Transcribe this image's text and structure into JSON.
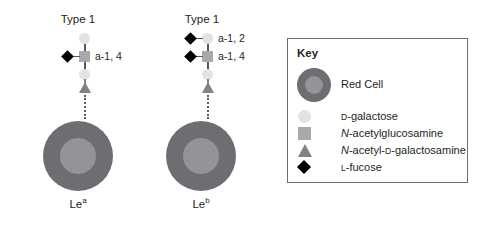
{
  "figure": {
    "background_color": "#ffffff",
    "palette": {
      "red_cell_outer": "#6d6e71",
      "red_cell_inner": "#929497",
      "d_galactose": "#e3e3e1",
      "n_acetylglucosamine": "#a7a9ac",
      "n_acetyl_d_galactosamine": "#808285",
      "l_fucose": "#000000",
      "line": "#58595b",
      "key_border": "#6d6e71",
      "text": "#231f20"
    }
  },
  "panels": [
    {
      "id": "lewis-a",
      "chain_type_label": "Type 1",
      "antigen_label_text": "Le",
      "antigen_label_superscript": "a",
      "linkages": [
        {
          "label": "a-1, 4",
          "attached_to": "n-acetylglucosamine"
        }
      ],
      "stack_top_to_bottom": [
        "d-galactose",
        "n-acetylglucosamine",
        "d-galactose",
        "n-acetyl-d-galactosamine"
      ],
      "fucose_count": 1
    },
    {
      "id": "lewis-b",
      "chain_type_label": "Type 1",
      "antigen_label_text": "Le",
      "antigen_label_superscript": "b",
      "linkages": [
        {
          "label": "a-1, 2",
          "attached_to": "d-galactose"
        },
        {
          "label": "a-1, 4",
          "attached_to": "n-acetylglucosamine"
        }
      ],
      "stack_top_to_bottom": [
        "d-galactose",
        "n-acetylglucosamine",
        "d-galactose",
        "n-acetyl-d-galactosamine"
      ],
      "fucose_count": 2
    }
  ],
  "key": {
    "title": "Key",
    "entries": [
      {
        "marker": "red-cell",
        "label_plain": "Red Cell",
        "parts": [
          {
            "text": "Red Cell",
            "style": "normal"
          }
        ]
      },
      {
        "marker": "circle",
        "label_plain": "D-galactose",
        "parts": [
          {
            "text": "d",
            "style": "smallcaps"
          },
          {
            "text": "-galactose",
            "style": "normal"
          }
        ]
      },
      {
        "marker": "square",
        "label_plain": "N-acetylglucosamine",
        "parts": [
          {
            "text": "N",
            "style": "italic"
          },
          {
            "text": "-acetylglucosamine",
            "style": "normal"
          }
        ]
      },
      {
        "marker": "triangle",
        "label_plain": "N-acetyl-D-galactosamine",
        "parts": [
          {
            "text": "N",
            "style": "italic"
          },
          {
            "text": "-acetyl-",
            "style": "normal"
          },
          {
            "text": "d",
            "style": "smallcaps"
          },
          {
            "text": "-galactosamine",
            "style": "normal"
          }
        ]
      },
      {
        "marker": "diamond",
        "label_plain": "L-fucose",
        "parts": [
          {
            "text": "l",
            "style": "smallcaps"
          },
          {
            "text": "-fucose",
            "style": "normal"
          }
        ]
      }
    ]
  }
}
